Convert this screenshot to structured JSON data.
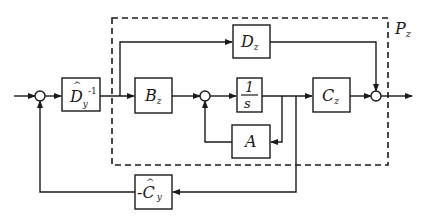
{
  "diagram": {
    "subsystem_label": "P",
    "subsystem_label_sub": "z",
    "blocks": {
      "dy_inv": {
        "main": "D",
        "hat": "^",
        "sub": "y",
        "sup": "-1"
      },
      "bz": {
        "main": "B",
        "sub": "z"
      },
      "integrator": {
        "num": "1",
        "den": "s"
      },
      "cz": {
        "main": "C",
        "sub": "z"
      },
      "dz": {
        "main": "D",
        "sub": "z"
      },
      "a": {
        "main": "A"
      },
      "cy_neg": {
        "prefix": "-",
        "main": "C",
        "hat": "^",
        "sub": "y"
      }
    },
    "colors": {
      "line": "#1a1a1a",
      "background": "#ffffff"
    }
  }
}
